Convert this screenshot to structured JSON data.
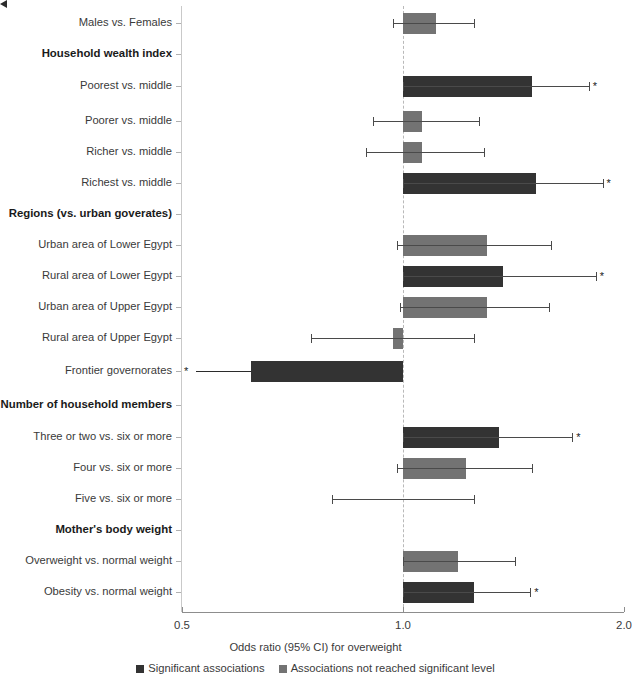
{
  "chart_data": {
    "type": "bar",
    "orientation": "horizontal",
    "title": "",
    "xlabel": "Odds ratio (95% CI) for overweight",
    "ylabel": "",
    "xscale": "log",
    "xlim": [
      0.5,
      2.0
    ],
    "xticks": [
      0.5,
      1.0,
      2.0
    ],
    "xtick_labels": [
      "0.5",
      "1.0",
      "2.0"
    ],
    "reference_line": 1.0,
    "grid": false,
    "legend_position": "bottom",
    "legend": [
      {
        "label": "Significant associations",
        "color": "#333333"
      },
      {
        "label": "Associations not reached significant level",
        "color": "#737373"
      }
    ],
    "rows": [
      {
        "label": "Males vs. Females",
        "group": false,
        "or": 1.11,
        "ci_low": 0.97,
        "ci_high": 1.25,
        "significant": false,
        "star": false,
        "arrow": false
      },
      {
        "label": "Household wealth index",
        "group": true
      },
      {
        "label": "Poorest vs. middle",
        "group": false,
        "or": 1.5,
        "ci_low": 1.0,
        "ci_high": 1.79,
        "significant": true,
        "star": true,
        "arrow": false
      },
      {
        "label": "Poorer vs. middle",
        "group": false,
        "or": 1.06,
        "ci_low": 0.91,
        "ci_high": 1.27,
        "significant": false,
        "star": false,
        "arrow": false
      },
      {
        "label": "Richer vs. middle",
        "group": false,
        "or": 1.06,
        "ci_low": 0.89,
        "ci_high": 1.29,
        "significant": false,
        "star": false,
        "arrow": false
      },
      {
        "label": "Richest vs. middle",
        "group": false,
        "or": 1.52,
        "ci_low": 1.0,
        "ci_high": 1.87,
        "significant": true,
        "star": true,
        "arrow": false
      },
      {
        "label": "Regions (vs. urban goverates)",
        "group": true
      },
      {
        "label": "Urban area of Lower Egypt",
        "group": false,
        "or": 1.3,
        "ci_low": 0.98,
        "ci_high": 1.59,
        "significant": false,
        "star": false,
        "arrow": false
      },
      {
        "label": "Rural area of Lower Egypt",
        "group": false,
        "or": 1.37,
        "ci_low": 1.0,
        "ci_high": 1.83,
        "significant": true,
        "star": true,
        "arrow": false
      },
      {
        "label": "Urban area of Upper Egypt",
        "group": false,
        "or": 1.3,
        "ci_low": 0.99,
        "ci_high": 1.58,
        "significant": false,
        "star": false,
        "arrow": false
      },
      {
        "label": "Rural area of Upper Egypt",
        "group": false,
        "or": 0.97,
        "ci_low": 0.75,
        "ci_high": 1.25,
        "significant": false,
        "star": false,
        "arrow": false
      },
      {
        "label": "Frontier governorates",
        "group": false,
        "or": 0.62,
        "ci_low": 0.5,
        "ci_high": 1.0,
        "significant": true,
        "star": true,
        "arrow": true
      },
      {
        "label": "Number of household members",
        "group": true
      },
      {
        "label": "Three or two vs. six or more",
        "group": false,
        "or": 1.35,
        "ci_low": 1.0,
        "ci_high": 1.7,
        "significant": true,
        "star": true,
        "arrow": false
      },
      {
        "label": "Four vs. six or more",
        "group": false,
        "or": 1.22,
        "ci_low": 0.98,
        "ci_high": 1.5,
        "significant": false,
        "star": false,
        "arrow": false
      },
      {
        "label": "Five vs. six or more",
        "group": false,
        "or": 1.0,
        "ci_low": 0.8,
        "ci_high": 1.25,
        "significant": false,
        "star": false,
        "arrow": false
      },
      {
        "label": "Mother's body weight",
        "group": true
      },
      {
        "label": "Overweight vs. normal weight",
        "group": false,
        "or": 1.19,
        "ci_low": 1.0,
        "ci_high": 1.42,
        "significant": false,
        "star": false,
        "arrow": false
      },
      {
        "label": "Obesity vs. normal weight",
        "group": false,
        "or": 1.25,
        "ci_low": 1.0,
        "ci_high": 1.49,
        "significant": true,
        "star": true,
        "arrow": false
      }
    ]
  },
  "axis": {
    "x_title": "Odds ratio (95% CI) for overweight"
  }
}
